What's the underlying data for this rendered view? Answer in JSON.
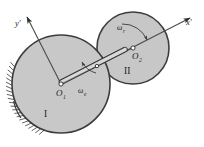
{
  "figure": {
    "background_color": "#ffffff",
    "disc_fill_color": "#c9c9c9",
    "outline_color": "#3a3a3a"
  },
  "axes": {
    "x_prime_label": "x'",
    "y_prime_label": "y'",
    "origin_label": "O1"
  },
  "discs": [
    {
      "id": "disc-one",
      "roman_label": "I",
      "center_label": "O",
      "center_subscript": "1",
      "cx": 61,
      "cy": 84,
      "r": 49,
      "fixed": true
    },
    {
      "id": "disc-two",
      "roman_label": "II",
      "center_label": "O",
      "center_subscript": "2",
      "cx": 133,
      "cy": 48,
      "r": 36,
      "fixed": false
    }
  ],
  "angular_velocities": [
    {
      "id": "omega-e",
      "symbol": "ω",
      "subscript": "e",
      "name": "omega-e",
      "description": "entrainment angular velocity of carrier about O1"
    },
    {
      "id": "omega-r",
      "symbol": "ω",
      "subscript": "r",
      "name": "omega-r",
      "description": "relative angular velocity of disc II about O2"
    }
  ],
  "rod": {
    "name": "connecting-rod",
    "from": "O1",
    "to": "O2"
  },
  "ground": {
    "name": "ground-hatching",
    "hatch_count": 22
  }
}
